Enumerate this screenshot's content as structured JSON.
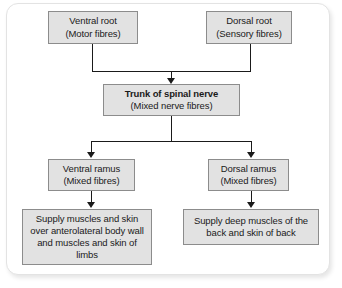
{
  "diagram": {
    "colors": {
      "node_fill": "#e2e2e2",
      "node_border": "#8c8c8c",
      "connector": "#1a1a1a",
      "frame_border": "#e3e3e3",
      "background": "#ffffff",
      "text": "#1a1a1a"
    },
    "nodes": {
      "ventral_root": {
        "line1": "Ventral root",
        "line2": "(Motor fibres)"
      },
      "dorsal_root": {
        "line1": "Dorsal root",
        "line2": "(Sensory fibres)"
      },
      "trunk": {
        "line1": "Trunk of spinal nerve",
        "line2": "(Mixed nerve fibres)"
      },
      "ventral_ramus": {
        "line1": "Ventral ramus",
        "line2": "(Mixed fibres)"
      },
      "dorsal_ramus": {
        "line1": "Dorsal ramus",
        "line2": "(Mixed fibres)"
      },
      "ventral_supply": {
        "text": "Supply muscles and skin over anterolateral body wall and muscles and skin of limbs"
      },
      "dorsal_supply": {
        "text": "Supply deep muscles of the back and skin of back"
      }
    },
    "connectors": [
      {
        "name": "ventral-root-to-merge",
        "from": "ventral_root",
        "to": "merge_bar_top"
      },
      {
        "name": "dorsal-root-to-merge",
        "from": "dorsal_root",
        "to": "merge_bar_top"
      },
      {
        "name": "merge-to-trunk",
        "from": "merge_bar_top",
        "to": "trunk",
        "arrow": true
      },
      {
        "name": "trunk-to-split",
        "from": "trunk",
        "to": "split_bar"
      },
      {
        "name": "split-to-ventral-ramus",
        "from": "split_bar",
        "to": "ventral_ramus",
        "arrow": true
      },
      {
        "name": "split-to-dorsal-ramus",
        "from": "split_bar",
        "to": "dorsal_ramus",
        "arrow": true
      },
      {
        "name": "ventral-ramus-to-supply",
        "from": "ventral_ramus",
        "to": "ventral_supply",
        "arrow": true
      },
      {
        "name": "dorsal-ramus-to-supply",
        "from": "dorsal_ramus",
        "to": "dorsal_supply",
        "arrow": true
      }
    ]
  }
}
